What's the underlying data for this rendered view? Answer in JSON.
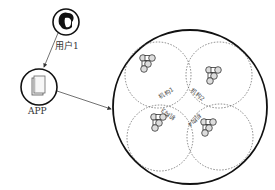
{
  "diagram": {
    "user": {
      "label": "用户1",
      "icon": "user-avatar-icon"
    },
    "app": {
      "label": "APP",
      "icon": "app-door-icon"
    },
    "cluster": {
      "institutions": [
        {
          "label": "机构1"
        },
        {
          "label": "机构2"
        },
        {
          "label": "机构3"
        },
        {
          "label": "机构4"
        }
      ]
    },
    "edges": [
      {
        "from": "用户1",
        "to": "APP"
      },
      {
        "from": "APP",
        "to": "cluster"
      }
    ]
  }
}
